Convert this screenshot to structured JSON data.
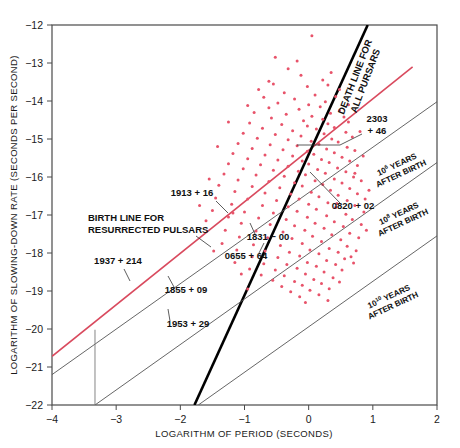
{
  "chart_data": {
    "type": "scatter",
    "title": "",
    "xlabel": "LOGARITHM OF PERIOD (SECONDS)",
    "ylabel": "LOGARITHM OF SLOWING-DOWN RATE (SECONDS PER SECOND)",
    "xlim": [
      -4,
      2
    ],
    "ylim": [
      -22,
      -12
    ],
    "xticks": [
      "-4",
      "-3",
      "-2",
      "-1",
      "0",
      "1",
      "2"
    ],
    "yticks": [
      "-12",
      "-13",
      "-14",
      "-15",
      "-16",
      "-17",
      "-18",
      "-19",
      "-20",
      "-21",
      "-22"
    ],
    "grid": false,
    "legend": "none",
    "point_color": "#e8536a",
    "point_count": 226,
    "points": [
      [
        0.05,
        -12.28
      ],
      [
        -0.32,
        -13.15
      ],
      [
        -0.12,
        -13.32
      ],
      [
        0.22,
        -13.45
      ],
      [
        -0.55,
        -13.55
      ],
      [
        -0.02,
        -13.62
      ],
      [
        0.3,
        -13.58
      ],
      [
        -0.38,
        -13.78
      ],
      [
        0.1,
        -13.84
      ],
      [
        -0.7,
        -13.9
      ],
      [
        -0.22,
        -13.95
      ],
      [
        0.42,
        -13.88
      ],
      [
        -0.48,
        -14.05
      ],
      [
        0.0,
        -14.1
      ],
      [
        0.26,
        -14.02
      ],
      [
        -0.62,
        -14.18
      ],
      [
        -0.15,
        -14.22
      ],
      [
        0.18,
        -14.15
      ],
      [
        0.48,
        -14.25
      ],
      [
        -0.85,
        -14.3
      ],
      [
        -0.35,
        -14.35
      ],
      [
        0.05,
        -14.4
      ],
      [
        0.34,
        -14.32
      ],
      [
        -0.58,
        -14.45
      ],
      [
        -0.08,
        -14.52
      ],
      [
        0.22,
        -14.48
      ],
      [
        0.55,
        -14.42
      ],
      [
        -0.92,
        -14.58
      ],
      [
        -0.42,
        -14.62
      ],
      [
        -0.02,
        -14.66
      ],
      [
        0.3,
        -14.6
      ],
      [
        0.62,
        -14.55
      ],
      [
        -0.72,
        -14.72
      ],
      [
        -0.25,
        -14.78
      ],
      [
        0.12,
        -14.74
      ],
      [
        0.4,
        -14.7
      ],
      [
        -1.02,
        -14.85
      ],
      [
        -0.52,
        -14.88
      ],
      [
        -0.12,
        -14.92
      ],
      [
        0.24,
        -14.86
      ],
      [
        0.58,
        -14.82
      ],
      [
        -0.8,
        -14.98
      ],
      [
        -0.32,
        -15.02
      ],
      [
        0.04,
        -15.06
      ],
      [
        0.36,
        -15.0
      ],
      [
        0.68,
        -14.95
      ],
      [
        -1.1,
        -15.12
      ],
      [
        -0.6,
        -15.15
      ],
      [
        -0.18,
        -15.18
      ],
      [
        0.16,
        -15.14
      ],
      [
        0.46,
        -15.08
      ],
      [
        -0.88,
        -15.25
      ],
      [
        -0.4,
        -15.28
      ],
      [
        -0.02,
        -15.32
      ],
      [
        0.28,
        -15.26
      ],
      [
        0.6,
        -15.22
      ],
      [
        -1.18,
        -15.38
      ],
      [
        -0.68,
        -15.42
      ],
      [
        -0.25,
        -15.45
      ],
      [
        0.08,
        -15.4
      ],
      [
        0.4,
        -15.36
      ],
      [
        0.72,
        -15.3
      ],
      [
        -0.95,
        -15.52
      ],
      [
        -0.48,
        -15.55
      ],
      [
        -0.1,
        -15.58
      ],
      [
        0.2,
        -15.54
      ],
      [
        0.52,
        -15.48
      ],
      [
        -1.25,
        -15.65
      ],
      [
        -0.75,
        -15.68
      ],
      [
        -0.32,
        -15.72
      ],
      [
        0.0,
        -15.66
      ],
      [
        0.32,
        -15.62
      ],
      [
        0.64,
        -15.58
      ],
      [
        -1.02,
        -15.78
      ],
      [
        -0.55,
        -15.82
      ],
      [
        -0.16,
        -15.85
      ],
      [
        0.14,
        -15.8
      ],
      [
        0.45,
        -15.76
      ],
      [
        0.76,
        -15.7
      ],
      [
        -1.32,
        -15.92
      ],
      [
        -0.82,
        -15.95
      ],
      [
        -0.38,
        -15.98
      ],
      [
        -0.05,
        -15.94
      ],
      [
        0.26,
        -15.9
      ],
      [
        0.58,
        -15.86
      ],
      [
        -1.1,
        -16.08
      ],
      [
        -0.62,
        -16.12
      ],
      [
        -0.22,
        -16.15
      ],
      [
        0.1,
        -16.1
      ],
      [
        0.4,
        -16.05
      ],
      [
        0.7,
        -16.0
      ],
      [
        -1.4,
        -16.22
      ],
      [
        -0.88,
        -16.25
      ],
      [
        -0.45,
        -16.28
      ],
      [
        -0.1,
        -16.24
      ],
      [
        0.22,
        -16.2
      ],
      [
        0.52,
        -16.16
      ],
      [
        0.82,
        -16.1
      ],
      [
        -1.15,
        -16.38
      ],
      [
        -0.68,
        -16.42
      ],
      [
        -0.28,
        -16.45
      ],
      [
        0.04,
        -16.4
      ],
      [
        0.34,
        -16.35
      ],
      [
        0.64,
        -16.3
      ],
      [
        -1.45,
        -16.55
      ],
      [
        -0.95,
        -16.58
      ],
      [
        -0.5,
        -16.62
      ],
      [
        -0.15,
        -16.58
      ],
      [
        0.16,
        -16.52
      ],
      [
        0.46,
        -16.48
      ],
      [
        0.76,
        -16.44
      ],
      [
        -1.2,
        -16.72
      ],
      [
        -0.72,
        -16.75
      ],
      [
        -0.32,
        -16.78
      ],
      [
        0.0,
        -16.72
      ],
      [
        0.3,
        -16.68
      ],
      [
        0.6,
        -16.62
      ],
      [
        0.88,
        -16.58
      ],
      [
        -1.5,
        -16.88
      ],
      [
        -1.0,
        -16.92
      ],
      [
        -0.55,
        -16.95
      ],
      [
        -0.18,
        -16.9
      ],
      [
        0.12,
        -16.85
      ],
      [
        0.42,
        -16.8
      ],
      [
        0.72,
        -16.75
      ],
      [
        -1.25,
        -17.05
      ],
      [
        -0.78,
        -17.08
      ],
      [
        -0.35,
        -17.12
      ],
      [
        -0.02,
        -17.06
      ],
      [
        0.28,
        -17.02
      ],
      [
        0.58,
        -16.98
      ],
      [
        0.86,
        -16.92
      ],
      [
        -1.05,
        -17.22
      ],
      [
        -0.6,
        -17.25
      ],
      [
        -0.22,
        -17.28
      ],
      [
        0.1,
        -17.22
      ],
      [
        0.4,
        -17.18
      ],
      [
        0.68,
        -17.12
      ],
      [
        -1.3,
        -17.4
      ],
      [
        -0.82,
        -17.42
      ],
      [
        -0.4,
        -17.45
      ],
      [
        -0.06,
        -17.4
      ],
      [
        0.24,
        -17.35
      ],
      [
        0.54,
        -17.3
      ],
      [
        0.82,
        -17.25
      ],
      [
        -1.08,
        -17.58
      ],
      [
        -0.64,
        -17.6
      ],
      [
        -0.26,
        -17.62
      ],
      [
        0.06,
        -17.56
      ],
      [
        0.36,
        -17.52
      ],
      [
        0.64,
        -17.48
      ],
      [
        -1.35,
        -17.75
      ],
      [
        -0.86,
        -17.78
      ],
      [
        -0.44,
        -17.8
      ],
      [
        -0.1,
        -17.75
      ],
      [
        0.2,
        -17.7
      ],
      [
        0.5,
        -17.65
      ],
      [
        0.78,
        -17.6
      ],
      [
        -1.12,
        -17.92
      ],
      [
        -0.68,
        -17.95
      ],
      [
        -0.3,
        -17.98
      ],
      [
        0.02,
        -17.92
      ],
      [
        0.32,
        -17.88
      ],
      [
        0.6,
        -17.82
      ],
      [
        -0.88,
        -18.1
      ],
      [
        -0.48,
        -18.12
      ],
      [
        -0.14,
        -18.08
      ],
      [
        0.16,
        -18.02
      ],
      [
        0.46,
        -17.98
      ],
      [
        0.74,
        -17.94
      ],
      [
        -1.15,
        -18.25
      ],
      [
        -0.7,
        -18.28
      ],
      [
        -0.34,
        -18.3
      ],
      [
        -0.02,
        -18.25
      ],
      [
        0.28,
        -18.2
      ],
      [
        0.56,
        -18.15
      ],
      [
        -0.92,
        -18.42
      ],
      [
        -0.52,
        -18.45
      ],
      [
        -0.18,
        -18.4
      ],
      [
        0.12,
        -18.35
      ],
      [
        0.42,
        -18.3
      ],
      [
        0.7,
        -18.26
      ],
      [
        -0.74,
        -18.58
      ],
      [
        -0.38,
        -18.6
      ],
      [
        -0.05,
        -18.55
      ],
      [
        0.24,
        -18.5
      ],
      [
        0.52,
        -18.45
      ],
      [
        -0.56,
        -18.72
      ],
      [
        -0.22,
        -18.75
      ],
      [
        0.08,
        -18.7
      ],
      [
        0.38,
        -18.65
      ],
      [
        -0.42,
        -18.88
      ],
      [
        -0.1,
        -18.85
      ],
      [
        0.2,
        -18.8
      ],
      [
        0.48,
        -18.76
      ],
      [
        -0.28,
        -19.02
      ],
      [
        0.02,
        -18.98
      ],
      [
        0.32,
        -18.94
      ],
      [
        -0.14,
        -19.15
      ],
      [
        0.16,
        -19.1
      ],
      [
        -0.62,
        -13.48
      ],
      [
        -0.95,
        -14.12
      ],
      [
        -1.25,
        -14.55
      ],
      [
        0.48,
        -13.7
      ],
      [
        0.35,
        -13.25
      ],
      [
        -0.18,
        -12.95
      ],
      [
        0.62,
        -14.1
      ],
      [
        -0.78,
        -13.7
      ],
      [
        0.72,
        -15.9
      ],
      [
        -1.55,
        -16.05
      ],
      [
        -1.6,
        -17.15
      ],
      [
        -1.42,
        -15.2
      ],
      [
        0.9,
        -17.4
      ],
      [
        0.85,
        -15.45
      ],
      [
        -1.7,
        -16.75
      ],
      [
        0.94,
        -16.35
      ],
      [
        -1.48,
        -17.95
      ],
      [
        -0.05,
        -19.3
      ],
      [
        0.3,
        -19.25
      ],
      [
        -0.95,
        -18.95
      ],
      [
        0.66,
        -18.1
      ],
      [
        -1.18,
        -16.95
      ],
      [
        0.8,
        -14.8
      ],
      [
        -0.52,
        -12.85
      ],
      [
        0.44,
        -16.7
      ],
      [
        -1.05,
        -18.55
      ]
    ],
    "lines": [
      {
        "name": "birth-line-resurrected-pulsars",
        "color": "#d94a5e",
        "width": 1.6,
        "p1": [
          -4.0,
          -20.72
        ],
        "p2": [
          1.62,
          -13.1
        ]
      },
      {
        "name": "death-line-all-pulsars",
        "color": "#000000",
        "width": 2.6,
        "p1": [
          -1.78,
          -22.0
        ],
        "p2": [
          0.92,
          -12.0
        ]
      },
      {
        "name": "age-line-1",
        "color": "#555555",
        "width": 0.9,
        "p1": [
          -4.0,
          -21.2
        ],
        "p2": [
          2.0,
          -14.02
        ]
      },
      {
        "name": "age-line-2",
        "color": "#555555",
        "width": 0.9,
        "p1": [
          -3.33,
          -22.0
        ],
        "p2": [
          2.0,
          -15.62
        ]
      },
      {
        "name": "age-line-3",
        "color": "#555555",
        "width": 0.9,
        "p1": [
          -1.72,
          -22.0
        ],
        "p2": [
          2.0,
          -17.55
        ]
      },
      {
        "name": "vertical-marker",
        "color": "#777777",
        "width": 0.9,
        "p1": [
          -3.33,
          -20.02
        ],
        "p2": [
          -3.33,
          -22.0
        ]
      }
    ],
    "annotations": {
      "birth_line": {
        "line1": "BIRTH LINE FOR",
        "line2": "RESURRECTED PULSARS"
      },
      "death_line": {
        "line1": "DEATH LINE FOR",
        "line2": "ALL PURSARS"
      },
      "age_lines": [
        {
          "base": "10",
          "exp": "6",
          "rest": "YEARS",
          "line2": "AFTER BIRTH"
        },
        {
          "base": "10",
          "exp": "8",
          "rest": "YEARS",
          "line2": "AFTER BIRTH"
        },
        {
          "base": "10",
          "exp": "10",
          "rest": "YEARS",
          "line2": "AFTER BIRTH"
        }
      ]
    },
    "pulsar_labels": [
      {
        "name": "1913 + 16",
        "text": "1913 + 16"
      },
      {
        "name": "1937 + 214",
        "text": "1937 + 214"
      },
      {
        "name": "1855 + 09",
        "text": "1855 + 09"
      },
      {
        "name": "1953 + 29",
        "text": "1953 + 29"
      },
      {
        "name": "1831 - 00",
        "text": "1831 − 00"
      },
      {
        "name": "0655 + 64",
        "text": "0655 + 64"
      },
      {
        "name": "0820 + 02",
        "text": "0820 + 02"
      },
      {
        "name": "2303 + 46",
        "line1": "2303",
        "line2": "+ 46"
      }
    ]
  }
}
